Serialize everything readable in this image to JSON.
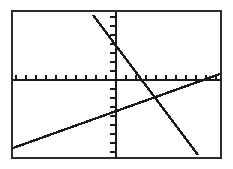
{
  "screen": {
    "device": "graphing-calculator-screen",
    "background_color": "#ffffff",
    "ink_color": "#1a1a1a",
    "border_color": "#2b2b2b"
  },
  "frame": {
    "left": 11,
    "top": 10,
    "right": 220,
    "bottom": 157,
    "stroke_width": 2
  },
  "chart_data": {
    "type": "line",
    "title": "",
    "subtitle": "",
    "xlabel": "",
    "ylabel": "",
    "grid": false,
    "legend_position": "none",
    "axes": {
      "x_axis_pixel_y": 80,
      "y_axis_pixel_x": 116,
      "x_tick_spacing_px": 10,
      "y_tick_spacing_px": 9,
      "x_tick_length_px": 4,
      "y_tick_length_px": 5,
      "xlim": [
        -10.5,
        10.4
      ],
      "ylim": [
        -8.6,
        7.8
      ],
      "x_tick_step": 1,
      "y_tick_step": 1
    },
    "series": [
      {
        "name": "descending-line",
        "role": "steep negative slope line",
        "slope": -1.72,
        "intercept": 2.9,
        "pixel_points": [
          [
            93,
            15
          ],
          [
            116,
            40
          ],
          [
            145,
            80
          ],
          [
            198,
            155
          ]
        ],
        "graph_points": [
          [
            -2.3,
            6.9
          ],
          [
            0.0,
            2.9
          ],
          [
            2.9,
            0.0
          ],
          [
            8.2,
            -7.5
          ]
        ]
      },
      {
        "name": "ascending-line",
        "role": "shallow positive slope line",
        "slope": 0.32,
        "intercept": -2.9,
        "pixel_points": [
          [
            13,
            148
          ],
          [
            116,
            108
          ],
          [
            152,
            90
          ],
          [
            220,
            74
          ]
        ],
        "graph_points": [
          [
            -10.3,
            -6.8
          ],
          [
            0.0,
            -2.9
          ],
          [
            3.6,
            -1.0
          ],
          [
            10.4,
            0.6
          ]
        ]
      }
    ],
    "annotations": [
      {
        "name": "intersection-point",
        "pixel": [
          152,
          90
        ],
        "graph": [
          3.6,
          -1.0
        ],
        "visible_marker": false
      }
    ]
  }
}
